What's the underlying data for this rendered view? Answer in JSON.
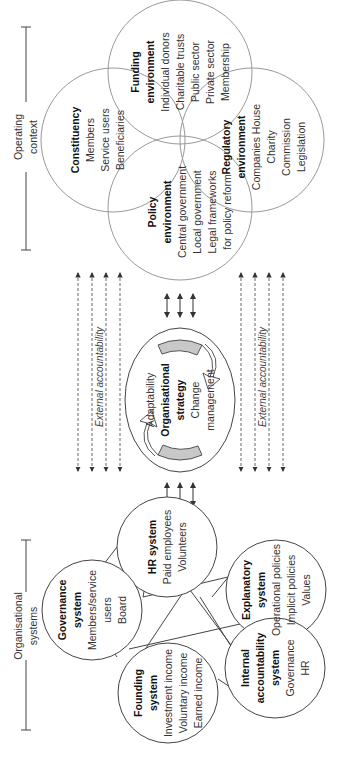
{
  "operating_context": {
    "label_line1": "Operating",
    "label_line2": "context",
    "environments": [
      {
        "title": "Funding",
        "title2": "environment",
        "items": [
          "Individual donors",
          "Charitable trusts",
          "Public sector",
          "Private sector",
          "Membership"
        ]
      },
      {
        "title": "Constituency",
        "title2": "",
        "items": [
          "Members",
          "Service users",
          "Beneficiaries"
        ]
      },
      {
        "title": "Regulatory",
        "title2": "environment",
        "items": [
          "Companies House",
          "Charity",
          "Commission",
          "Legislation"
        ]
      },
      {
        "title": "Policy",
        "title2": "environment",
        "items": [
          "Central government",
          "Local government",
          "Legal frameworks",
          "for policy reform"
        ]
      }
    ]
  },
  "strategy": {
    "title_line1": "Organisational",
    "title_line2": "strategy",
    "left_label": "Adaptability",
    "right_label_line1": "Change",
    "right_label_line2": "management"
  },
  "accountability": {
    "left_label": "External accountability",
    "right_label": "External accountability"
  },
  "organisational_systems": {
    "label_line1": "Organisational",
    "label_line2": "systems",
    "systems": [
      {
        "title": "HR system",
        "title2": "",
        "items": [
          "Paid employees",
          "Volunteers"
        ]
      },
      {
        "title": "Explanatory",
        "title2": "system",
        "items": [
          "Operational policies",
          "Implicit policies",
          "Values"
        ]
      },
      {
        "title": "Governance",
        "title2": "system",
        "items": [
          "Members/service",
          "users",
          "Board"
        ]
      },
      {
        "title": "Internal",
        "title2": "accountability",
        "title3": "system",
        "items": [
          "Governance",
          "HR"
        ]
      },
      {
        "title": "Founding",
        "title2": "system",
        "items": [
          "Investment income",
          "Voluntary income",
          "Earned income"
        ]
      }
    ]
  },
  "colors": {
    "line": "#555555",
    "venn": "#999999",
    "arrow_fill": "#c8c8c8"
  }
}
